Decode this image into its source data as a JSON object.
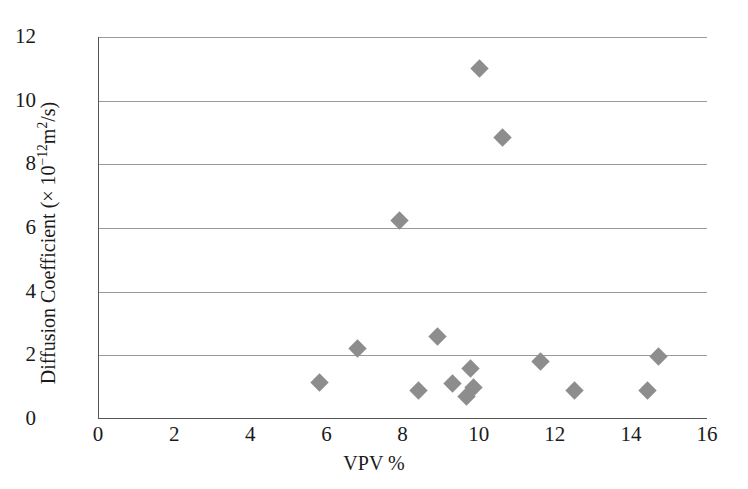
{
  "chart_data": {
    "type": "scatter",
    "title": "",
    "xlabel": "VPV %",
    "ylabel": "Diffusion Coefficient (× 10−12m2/s)",
    "ylabel_parts": {
      "prefix": "Diffusion Coefficient (× 10",
      "exp1": "−12",
      "mid": "m",
      "exp2": "2",
      "suffix": "/s)"
    },
    "xlim": [
      0,
      16
    ],
    "ylim": [
      0,
      12
    ],
    "xticks": [
      0,
      2,
      4,
      6,
      8,
      10,
      12,
      14,
      16
    ],
    "yticks": [
      0,
      2,
      4,
      6,
      8,
      10,
      12
    ],
    "xtick_labels": [
      "0",
      "2",
      "4",
      "6",
      "8",
      "10",
      "12",
      "14",
      "16"
    ],
    "ytick_labels": [
      "0",
      "2",
      "4",
      "6",
      "8",
      "10",
      "12"
    ],
    "grid": "horizontal",
    "gridlines_y": [
      2,
      4,
      6,
      8,
      10,
      12
    ],
    "legend": null,
    "marker_shape": "diamond",
    "marker_color": "#8d8d8d",
    "series": [
      {
        "name": "Diffusion Coefficient vs VPV",
        "points": [
          {
            "x": 5.8,
            "y": 1.15
          },
          {
            "x": 6.8,
            "y": 2.2
          },
          {
            "x": 7.9,
            "y": 6.25
          },
          {
            "x": 8.4,
            "y": 0.9
          },
          {
            "x": 8.9,
            "y": 2.6
          },
          {
            "x": 9.3,
            "y": 1.1
          },
          {
            "x": 9.65,
            "y": 0.7
          },
          {
            "x": 9.75,
            "y": 1.6
          },
          {
            "x": 9.85,
            "y": 1.0
          },
          {
            "x": 10.0,
            "y": 11.0
          },
          {
            "x": 10.6,
            "y": 8.85
          },
          {
            "x": 11.6,
            "y": 1.8
          },
          {
            "x": 12.5,
            "y": 0.9
          },
          {
            "x": 14.4,
            "y": 0.9
          },
          {
            "x": 14.7,
            "y": 1.95
          }
        ]
      }
    ]
  },
  "colors": {
    "marker": "#8d8d8d",
    "grid": "#9a9a9a",
    "axis": "#555555",
    "text": "#1a1a1a",
    "background": "#ffffff"
  }
}
